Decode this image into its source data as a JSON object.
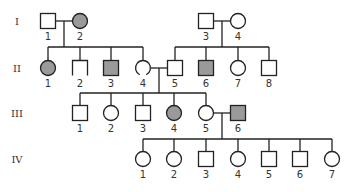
{
  "diagram": {
    "type": "pedigree",
    "colors": {
      "affected": "#9a9a9a",
      "unaffected": "#ffffff",
      "line": "#222222"
    },
    "generations": [
      {
        "label": "I",
        "y": 21
      },
      {
        "label": "II",
        "y": 68
      },
      {
        "label": "III",
        "y": 113
      },
      {
        "label": "IV",
        "y": 159
      }
    ],
    "individuals": [
      {
        "id": "I-1",
        "gen": 0,
        "num": "1",
        "sex": "male",
        "affected": false,
        "x": 48
      },
      {
        "id": "I-2",
        "gen": 0,
        "num": "2",
        "sex": "female",
        "affected": true,
        "x": 80
      },
      {
        "id": "I-3",
        "gen": 0,
        "num": "3",
        "sex": "male",
        "affected": false,
        "x": 206
      },
      {
        "id": "I-4",
        "gen": 0,
        "num": "4",
        "sex": "female",
        "affected": false,
        "x": 238
      },
      {
        "id": "II-1",
        "gen": 1,
        "num": "1",
        "sex": "female",
        "affected": true,
        "x": 48
      },
      {
        "id": "II-2",
        "gen": 1,
        "num": "2",
        "sex": "male-partial",
        "affected": false,
        "x": 80
      },
      {
        "id": "II-3",
        "gen": 1,
        "num": "3",
        "sex": "male",
        "affected": true,
        "x": 111
      },
      {
        "id": "II-4",
        "gen": 1,
        "num": "4",
        "sex": "female-open",
        "affected": false,
        "x": 143
      },
      {
        "id": "II-5",
        "gen": 1,
        "num": "5",
        "sex": "male",
        "affected": false,
        "x": 175
      },
      {
        "id": "II-6",
        "gen": 1,
        "num": "6",
        "sex": "male",
        "affected": true,
        "x": 206
      },
      {
        "id": "II-7",
        "gen": 1,
        "num": "7",
        "sex": "female",
        "affected": false,
        "x": 238
      },
      {
        "id": "II-8",
        "gen": 1,
        "num": "8",
        "sex": "male",
        "affected": false,
        "x": 269
      },
      {
        "id": "III-1",
        "gen": 2,
        "num": "1",
        "sex": "male",
        "affected": false,
        "x": 80
      },
      {
        "id": "III-2",
        "gen": 2,
        "num": "2",
        "sex": "female",
        "affected": false,
        "x": 111
      },
      {
        "id": "III-3",
        "gen": 2,
        "num": "3",
        "sex": "male",
        "affected": false,
        "x": 143
      },
      {
        "id": "III-4",
        "gen": 2,
        "num": "4",
        "sex": "female",
        "affected": true,
        "x": 174
      },
      {
        "id": "III-5",
        "gen": 2,
        "num": "5",
        "sex": "female",
        "affected": false,
        "x": 206
      },
      {
        "id": "III-6",
        "gen": 2,
        "num": "6",
        "sex": "male",
        "affected": true,
        "x": 238
      },
      {
        "id": "IV-1",
        "gen": 3,
        "num": "1",
        "sex": "female",
        "affected": false,
        "x": 143
      },
      {
        "id": "IV-2",
        "gen": 3,
        "num": "2",
        "sex": "female",
        "affected": false,
        "x": 174
      },
      {
        "id": "IV-3",
        "gen": 3,
        "num": "3",
        "sex": "male",
        "affected": false,
        "x": 206
      },
      {
        "id": "IV-4",
        "gen": 3,
        "num": "4",
        "sex": "female",
        "affected": false,
        "x": 238
      },
      {
        "id": "IV-5",
        "gen": 3,
        "num": "5",
        "sex": "male",
        "affected": false,
        "x": 269
      },
      {
        "id": "IV-6",
        "gen": 3,
        "num": "6",
        "sex": "male",
        "affected": false,
        "x": 300
      },
      {
        "id": "IV-7",
        "gen": 3,
        "num": "7",
        "sex": "female",
        "affected": false,
        "x": 332
      }
    ],
    "lines": [
      [
        56,
        21,
        72,
        21
      ],
      [
        64,
        21,
        64,
        47
      ],
      [
        48,
        47,
        143,
        47
      ],
      [
        48,
        47,
        48,
        61
      ],
      [
        80,
        47,
        80,
        61
      ],
      [
        111,
        47,
        111,
        61
      ],
      [
        143,
        47,
        143,
        61
      ],
      [
        214,
        21,
        230,
        21
      ],
      [
        222,
        21,
        222,
        47
      ],
      [
        175,
        47,
        269,
        47
      ],
      [
        175,
        47,
        175,
        61
      ],
      [
        206,
        47,
        206,
        61
      ],
      [
        238,
        47,
        238,
        61
      ],
      [
        269,
        47,
        269,
        61
      ],
      [
        151,
        68,
        168,
        68
      ],
      [
        159,
        68,
        159,
        93
      ],
      [
        80,
        93,
        206,
        93
      ],
      [
        80,
        93,
        80,
        106
      ],
      [
        111,
        93,
        111,
        106
      ],
      [
        143,
        93,
        143,
        106
      ],
      [
        174,
        93,
        174,
        106
      ],
      [
        206,
        93,
        206,
        106
      ],
      [
        214,
        113,
        231,
        113
      ],
      [
        222,
        113,
        222,
        139
      ],
      [
        143,
        139,
        332,
        139
      ],
      [
        143,
        139,
        143,
        151
      ],
      [
        174,
        139,
        174,
        151
      ],
      [
        206,
        139,
        206,
        152
      ],
      [
        238,
        139,
        238,
        151
      ],
      [
        269,
        139,
        269,
        152
      ],
      [
        300,
        139,
        300,
        152
      ],
      [
        332,
        139,
        332,
        151
      ]
    ]
  }
}
